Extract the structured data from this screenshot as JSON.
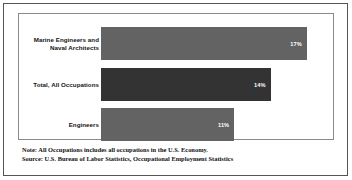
{
  "figure": {
    "frame_color": "#8a8a8a",
    "border_color": "#555555",
    "background": "#ffffff"
  },
  "notes": {
    "note_line": "Note: All Occupations includes all occupations in the U.S. Economy.",
    "source_line": "Source: U.S. Bureau of Labor Statistics, Occupational Employment Statistics"
  },
  "chart_data": {
    "type": "bar",
    "orientation": "horizontal",
    "title": "",
    "subtitle": "",
    "xlabel": "",
    "ylabel": "",
    "grid": false,
    "legend": false,
    "axis_ticks_visible": false,
    "xlim": [
      0,
      18.5
    ],
    "categories": [
      "Marine Engineers and Naval Architects",
      "Total, All Occupations",
      "Engineers"
    ],
    "values": [
      17,
      14,
      11
    ],
    "value_labels": [
      "17%",
      "14%",
      "11%"
    ],
    "bar_colors": [
      "#636363",
      "#333333",
      "#636363"
    ],
    "value_label_color": "#ffffff",
    "bars": [
      {
        "label_line1": "Marine Engineers and",
        "label_line2": "Naval Architects",
        "value": 17,
        "value_label": "17%",
        "color": "#636363"
      },
      {
        "label_line1": "Total, All Occupations",
        "label_line2": "",
        "value": 14,
        "value_label": "14%",
        "color": "#333333"
      },
      {
        "label_line1": "Engineers",
        "label_line2": "",
        "value": 11,
        "value_label": "11%",
        "color": "#636363"
      }
    ]
  }
}
